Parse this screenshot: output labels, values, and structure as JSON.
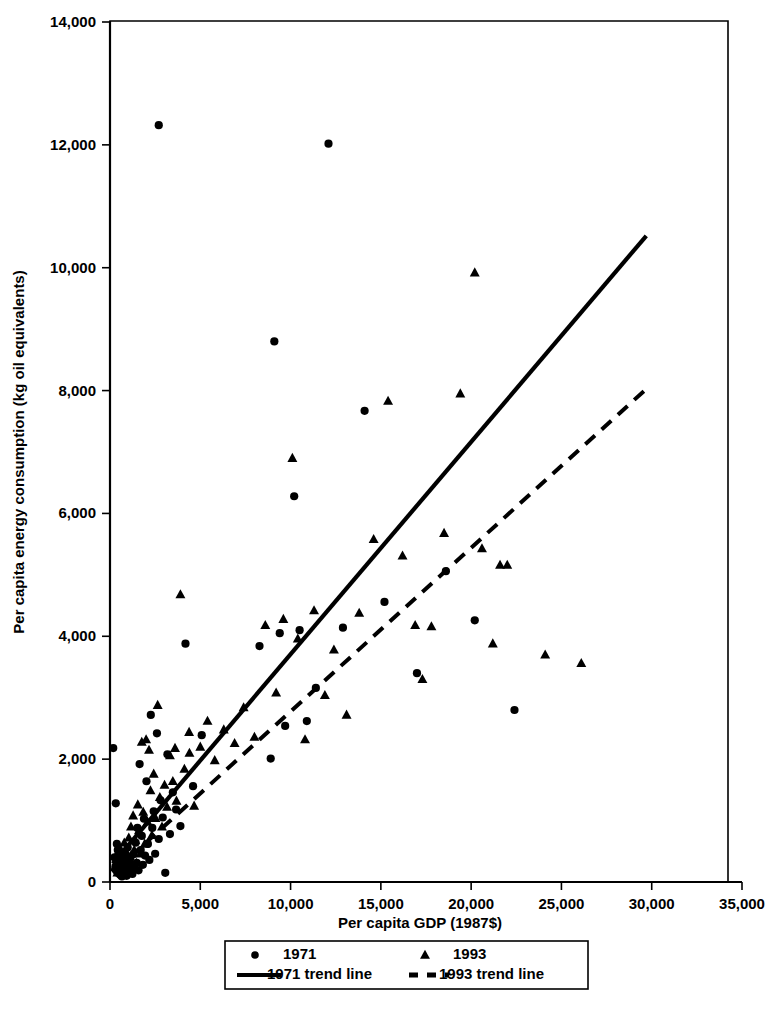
{
  "chart_data": {
    "type": "scatter",
    "title": "",
    "xlabel": "Per capita GDP (1987$)",
    "ylabel": "Per capita energy consumption (kg oil equivalents)",
    "xlim": [
      0,
      35000
    ],
    "ylim": [
      0,
      14000
    ],
    "grid": false,
    "legend_position": "below-axis",
    "x_ticks": [
      0,
      5000,
      10000,
      15000,
      20000,
      25000,
      30000,
      35000
    ],
    "x_tick_labels": [
      "0",
      "5,000",
      "10,000",
      "15,000",
      "20,000",
      "25,000",
      "30,000",
      "35,000"
    ],
    "y_ticks": [
      0,
      2000,
      4000,
      6000,
      8000,
      10000,
      12000,
      14000
    ],
    "y_tick_labels": [
      "0",
      "2,000",
      "4,000",
      "6,000",
      "8,000",
      "10,000",
      "12,000",
      "14,000"
    ],
    "legend": [
      {
        "label": "1971",
        "marker": "circle",
        "style": "marker"
      },
      {
        "label": "1993",
        "marker": "triangle",
        "style": "marker"
      },
      {
        "label": "1971 trend line",
        "marker": "solid-line",
        "style": "line"
      },
      {
        "label": "1993 trend line",
        "marker": "dashed-line",
        "style": "line"
      }
    ],
    "series": [
      {
        "name": "1971",
        "marker": "circle",
        "color": "#000000",
        "points": [
          [
            180,
            2180
          ],
          [
            320,
            1280
          ],
          [
            380,
            620
          ],
          [
            250,
            400
          ],
          [
            300,
            250
          ],
          [
            420,
            150
          ],
          [
            520,
            330
          ],
          [
            560,
            120
          ],
          [
            610,
            210
          ],
          [
            430,
            520
          ],
          [
            660,
            90
          ],
          [
            700,
            260
          ],
          [
            760,
            430
          ],
          [
            830,
            180
          ],
          [
            880,
            340
          ],
          [
            920,
            100
          ],
          [
            980,
            560
          ],
          [
            1020,
            240
          ],
          [
            1080,
            170
          ],
          [
            1120,
            390
          ],
          [
            1180,
            290
          ],
          [
            1240,
            130
          ],
          [
            1300,
            450
          ],
          [
            1360,
            220
          ],
          [
            1420,
            640
          ],
          [
            1480,
            310
          ],
          [
            1520,
            880
          ],
          [
            1580,
            190
          ],
          [
            1640,
            1920
          ],
          [
            1700,
            520
          ],
          [
            1760,
            750
          ],
          [
            1820,
            280
          ],
          [
            1880,
            1030
          ],
          [
            1940,
            430
          ],
          [
            2020,
            1640
          ],
          [
            2100,
            620
          ],
          [
            2180,
            360
          ],
          [
            2260,
            2720
          ],
          [
            2340,
            880
          ],
          [
            2420,
            1150
          ],
          [
            2500,
            460
          ],
          [
            2600,
            2420
          ],
          [
            2700,
            700
          ],
          [
            2800,
            1330
          ],
          [
            2920,
            1050
          ],
          [
            3060,
            150
          ],
          [
            3180,
            2080
          ],
          [
            3320,
            780
          ],
          [
            3480,
            1460
          ],
          [
            3660,
            1180
          ],
          [
            3900,
            910
          ],
          [
            4180,
            3880
          ],
          [
            4600,
            1560
          ],
          [
            5080,
            2390
          ],
          [
            8280,
            3840
          ],
          [
            8900,
            2010
          ],
          [
            9100,
            8800
          ],
          [
            9400,
            4050
          ],
          [
            9700,
            2540
          ],
          [
            10200,
            6280
          ],
          [
            10500,
            4100
          ],
          [
            10900,
            2620
          ],
          [
            11400,
            3160
          ],
          [
            12100,
            12020
          ],
          [
            12900,
            4140
          ],
          [
            14100,
            7670
          ],
          [
            15200,
            4560
          ],
          [
            17000,
            3400
          ],
          [
            18600,
            5060
          ],
          [
            20200,
            4260
          ],
          [
            22400,
            2800
          ],
          [
            2700,
            12320
          ]
        ]
      },
      {
        "name": "1993",
        "marker": "triangle",
        "color": "#000000",
        "points": [
          [
            260,
            240
          ],
          [
            340,
            430
          ],
          [
            410,
            150
          ],
          [
            480,
            330
          ],
          [
            540,
            560
          ],
          [
            600,
            210
          ],
          [
            670,
            380
          ],
          [
            730,
            110
          ],
          [
            790,
            640
          ],
          [
            860,
            290
          ],
          [
            920,
            480
          ],
          [
            980,
            180
          ],
          [
            1040,
            720
          ],
          [
            1100,
            350
          ],
          [
            1160,
            900
          ],
          [
            1220,
            250
          ],
          [
            1280,
            1080
          ],
          [
            1340,
            520
          ],
          [
            1400,
            680
          ],
          [
            1460,
            310
          ],
          [
            1540,
            1260
          ],
          [
            1600,
            840
          ],
          [
            1680,
            460
          ],
          [
            1760,
            2280
          ],
          [
            1840,
            1140
          ],
          [
            1920,
            620
          ],
          [
            2000,
            2320
          ],
          [
            2080,
            980
          ],
          [
            2160,
            2150
          ],
          [
            2240,
            1490
          ],
          [
            2320,
            760
          ],
          [
            2420,
            1760
          ],
          [
            2520,
            1040
          ],
          [
            2640,
            2880
          ],
          [
            2760,
            1380
          ],
          [
            2880,
            900
          ],
          [
            3020,
            1580
          ],
          [
            3160,
            1220
          ],
          [
            3320,
            2060
          ],
          [
            3480,
            1640
          ],
          [
            3680,
            1320
          ],
          [
            3900,
            4680
          ],
          [
            4120,
            1840
          ],
          [
            4380,
            2440
          ],
          [
            4660,
            1240
          ],
          [
            5000,
            2200
          ],
          [
            5400,
            2620
          ],
          [
            5800,
            1980
          ],
          [
            6300,
            2480
          ],
          [
            6900,
            2260
          ],
          [
            7400,
            2840
          ],
          [
            8000,
            2360
          ],
          [
            8600,
            4180
          ],
          [
            9200,
            3080
          ],
          [
            9600,
            4280
          ],
          [
            10100,
            6900
          ],
          [
            10400,
            3960
          ],
          [
            10800,
            2320
          ],
          [
            11300,
            4420
          ],
          [
            11900,
            3040
          ],
          [
            12400,
            3780
          ],
          [
            13100,
            2720
          ],
          [
            13800,
            4380
          ],
          [
            14600,
            5580
          ],
          [
            15400,
            7830
          ],
          [
            16200,
            5310
          ],
          [
            16900,
            4180
          ],
          [
            17300,
            3300
          ],
          [
            17800,
            4160
          ],
          [
            18500,
            5680
          ],
          [
            19400,
            7950
          ],
          [
            20200,
            9920
          ],
          [
            20600,
            5430
          ],
          [
            21200,
            3880
          ],
          [
            21600,
            5160
          ],
          [
            22000,
            5160
          ],
          [
            24100,
            3700
          ],
          [
            26100,
            3560
          ],
          [
            4400,
            2100
          ],
          [
            3600,
            2180
          ]
        ]
      }
    ],
    "trend_lines": [
      {
        "name": "1971 trend line",
        "style": "solid",
        "x_start": 150,
        "y_start": 300,
        "x_end": 29700,
        "y_end": 10520
      },
      {
        "name": "1993 trend line",
        "style": "dashed",
        "x_start": 150,
        "y_start": 150,
        "x_end": 29600,
        "y_end": 8000
      }
    ]
  }
}
